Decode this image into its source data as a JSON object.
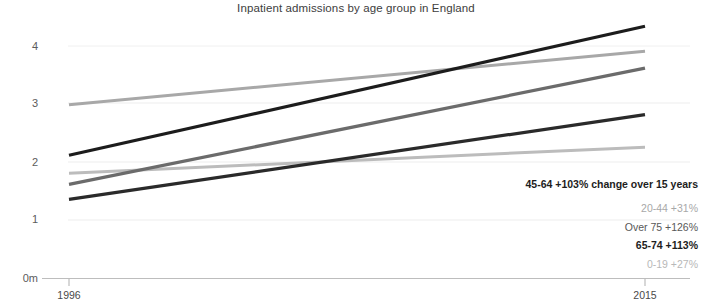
{
  "chart_data": {
    "type": "line",
    "title": "Inpatient admissions by age group in England",
    "title_clipped_above": "Hospital admissions have risen sharply",
    "xlabel": "",
    "ylabel": "",
    "x": [
      1996,
      2015
    ],
    "xtick_labels": [
      "1996",
      "2015"
    ],
    "ytick_labels": [
      "0m",
      "1",
      "2",
      "3",
      "4"
    ],
    "ytick_values": [
      0,
      1,
      2,
      3,
      4
    ],
    "ylim": [
      0,
      4.45
    ],
    "xlim": [
      1996,
      2015
    ],
    "grid": true,
    "legend_position": "bottom-right",
    "units": "millions",
    "series": [
      {
        "name": "45-64",
        "label": "45-64 +103%",
        "change_pct": "+103%",
        "values": [
          2.12,
          4.34
        ],
        "color": "#1c1c1c",
        "width": 3.2,
        "tone": "dark"
      },
      {
        "name": "20-44",
        "label": "20-44 +31%",
        "change_pct": "+31%",
        "values": [
          2.99,
          3.91
        ],
        "color": "#a8a8a8",
        "width": 3.0,
        "tone": "light"
      },
      {
        "name": "Over 75",
        "label": "Over 75 +126%",
        "change_pct": "+126%",
        "values": [
          1.62,
          3.62
        ],
        "color": "#6b6b6b",
        "width": 3.2,
        "tone": "mid"
      },
      {
        "name": "65-74",
        "label": "65-74 +113%",
        "change_pct": "+113%",
        "values": [
          1.36,
          2.82
        ],
        "color": "#2a2a2a",
        "width": 3.2,
        "tone": "dark"
      },
      {
        "name": "0-19",
        "label": "0-19 +27%",
        "change_pct": "+27%",
        "values": [
          1.81,
          2.26
        ],
        "color": "#bcbcbc",
        "width": 3.0,
        "tone": "xlight"
      }
    ],
    "annotation": "change over\n15 years"
  },
  "axis": {
    "y_labels": [
      {
        "text": "4",
        "top": 41
      },
      {
        "text": "3",
        "top": 98
      },
      {
        "text": "2",
        "top": 157
      },
      {
        "text": "1",
        "top": 214
      },
      {
        "text": "0m",
        "top": 273
      }
    ],
    "x_labels": [
      {
        "text": "1996",
        "left": 40
      },
      {
        "text": "2015",
        "left": 615
      }
    ]
  },
  "legend": {
    "entries": [
      {
        "label": "45-64 +103%",
        "note": " change over\n15 years",
        "tone": "dark"
      },
      {
        "label": "20-44 +31%",
        "note": "",
        "tone": "light"
      },
      {
        "label": "Over 75 +126%",
        "note": "",
        "tone": "mid"
      },
      {
        "label": "65-74 +113%",
        "note": "",
        "tone": "dark"
      },
      {
        "label": "0-19 +27%",
        "note": "",
        "tone": "xlight"
      }
    ]
  },
  "colors": {
    "background": "#ffffff",
    "axis_line": "#b9b9b9",
    "gridline": "#ebebeb",
    "text": "#3a3a3a"
  }
}
